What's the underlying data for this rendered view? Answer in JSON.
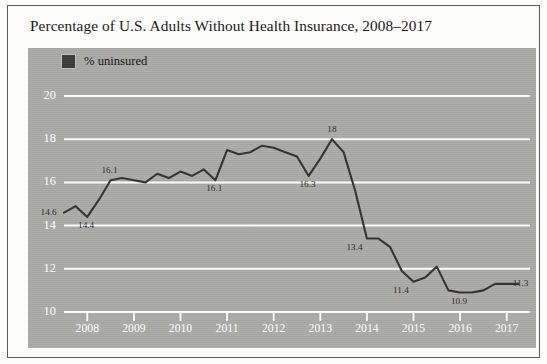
{
  "figure": {
    "title": "Percentage of U.S. Adults Without Health Insurance, 2008–2017",
    "legend_label": "% uninsured",
    "legend_swatch_color": "#3c3b39",
    "panel_color": "#a9a9a6",
    "gridline_color": "#ffffff",
    "line_color": "#33322f"
  },
  "chart_data": {
    "type": "line",
    "title": "Percentage of U.S. Adults Without Health Insurance, 2008–2017",
    "xlabel": "",
    "ylabel": "",
    "ylim": [
      10,
      20
    ],
    "yticks": [
      10,
      12,
      14,
      16,
      18,
      20
    ],
    "xlim": [
      2008,
      2018
    ],
    "xticks": [
      2008,
      2009,
      2010,
      2011,
      2012,
      2013,
      2014,
      2015,
      2016,
      2017
    ],
    "grid": true,
    "legend": [
      "% uninsured"
    ],
    "legend_position": "top-left",
    "series": [
      {
        "name": "% uninsured",
        "x": [
          2008.0,
          2008.25,
          2008.5,
          2008.75,
          2009.0,
          2009.25,
          2009.5,
          2009.75,
          2010.0,
          2010.25,
          2010.5,
          2010.75,
          2011.0,
          2011.25,
          2011.5,
          2011.75,
          2012.0,
          2012.25,
          2012.5,
          2012.75,
          2013.0,
          2013.25,
          2013.5,
          2013.75,
          2014.0,
          2014.25,
          2014.5,
          2014.75,
          2015.0,
          2015.25,
          2015.5,
          2015.75,
          2016.0,
          2016.25,
          2016.5,
          2016.75,
          2017.0,
          2017.25,
          2017.5,
          2017.75
        ],
        "values": [
          14.6,
          14.9,
          14.4,
          15.2,
          16.1,
          16.2,
          16.1,
          16.0,
          16.4,
          16.2,
          16.5,
          16.3,
          16.6,
          16.1,
          17.5,
          17.3,
          17.4,
          17.7,
          17.6,
          17.4,
          17.2,
          16.3,
          17.1,
          18.0,
          17.4,
          15.6,
          13.4,
          13.4,
          13.0,
          11.9,
          11.4,
          11.6,
          12.1,
          11.0,
          10.9,
          10.9,
          11.0,
          11.3,
          11.3,
          11.3
        ]
      }
    ],
    "point_labels": [
      {
        "text": "14.6",
        "x": 2008.0,
        "y": 14.6,
        "anchor": "left"
      },
      {
        "text": "14.4",
        "x": 2008.5,
        "y": 14.4,
        "anchor": "below"
      },
      {
        "text": "16.1",
        "x": 2009.0,
        "y": 16.1,
        "anchor": "above"
      },
      {
        "text": "16.1",
        "x": 2011.25,
        "y": 16.1,
        "anchor": "below"
      },
      {
        "text": "16.3",
        "x": 2013.25,
        "y": 16.3,
        "anchor": "below"
      },
      {
        "text": "18",
        "x": 2013.75,
        "y": 18.0,
        "anchor": "above"
      },
      {
        "text": "13.4",
        "x": 2014.5,
        "y": 13.4,
        "anchor": "below-left"
      },
      {
        "text": "11.4",
        "x": 2015.5,
        "y": 11.4,
        "anchor": "below-left"
      },
      {
        "text": "10.9",
        "x": 2016.5,
        "y": 10.9,
        "anchor": "below"
      },
      {
        "text": "11.3",
        "x": 2017.5,
        "y": 11.3,
        "anchor": "right"
      }
    ]
  }
}
